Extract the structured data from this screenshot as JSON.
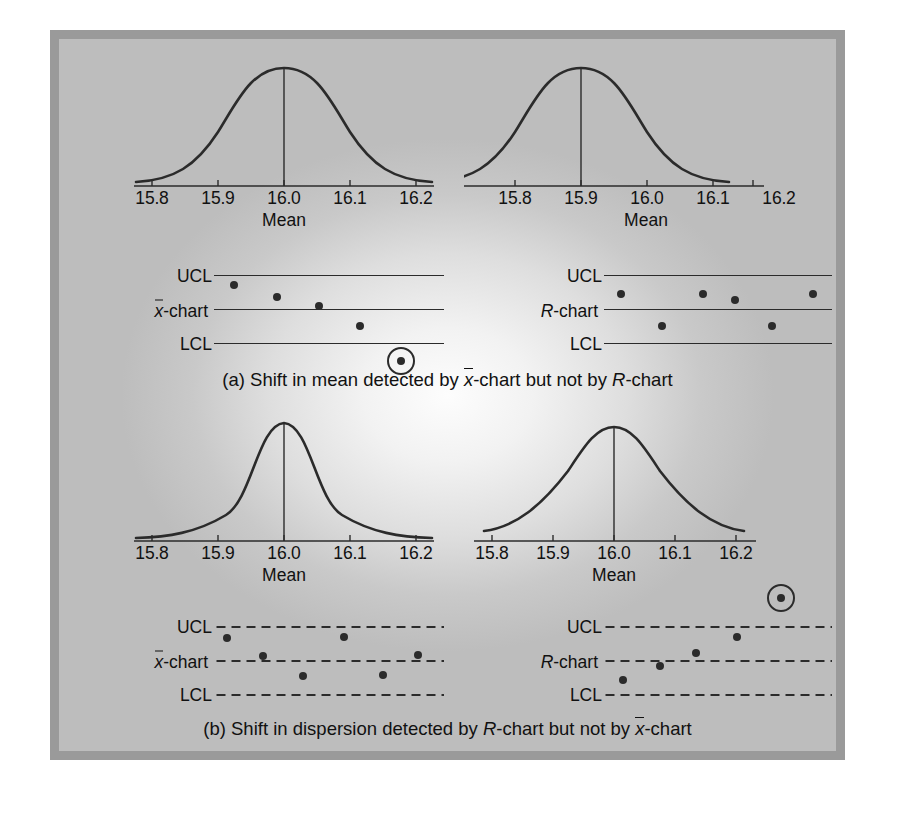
{
  "figure": {
    "frame_color": "#9a9a9a",
    "ink_color": "#2b2b2b"
  },
  "axis": {
    "ticks": [
      "15.8",
      "15.9",
      "16.0",
      "16.1",
      "16.2"
    ],
    "caption": "Mean"
  },
  "labels": {
    "xbar_chart": "-chart",
    "xbar_symbol": "x",
    "r_chart": "-chart",
    "r_symbol": "R",
    "ucl": "UCL",
    "lcl": "LCL"
  },
  "sections": [
    {
      "id": "a",
      "caption_prefix": "(a) Shift in mean detected by ",
      "caption_symbol1": "x",
      "caption_mid": "-chart but not by ",
      "caption_symbol2": "R",
      "caption_suffix": "-chart",
      "left_dist": {
        "name": "in-control-mean-curve",
        "mean": 16.0,
        "sigma": 0.072,
        "peak_label": "16.0",
        "shape": "normal"
      },
      "right_dist": {
        "name": "shifted-mean-curve",
        "mean": 15.9,
        "sigma": 0.072,
        "peak_label": "15.9",
        "shape": "normal"
      },
      "xbar": {
        "line_style": "solid",
        "points": [
          0.085,
          0.275,
          0.455,
          0.635,
          0.815
        ],
        "values": [
          0.88,
          0.64,
          0.47,
          0.22,
          -0.3
        ],
        "flagged_index": 4
      },
      "rchart": {
        "line_style": "solid",
        "points": [
          0.075,
          0.255,
          0.435,
          0.575,
          0.735,
          0.915
        ],
        "values": [
          0.6,
          0.16,
          0.6,
          0.52,
          0.16,
          0.6
        ],
        "flagged_index": -1
      }
    },
    {
      "id": "b",
      "caption_prefix": "(b) Shift in dispersion detected by ",
      "caption_symbol1": "R",
      "caption_mid": "-chart but not by ",
      "caption_symbol2": "x",
      "caption_suffix": "-chart",
      "left_dist": {
        "name": "narrow-dispersion-curve",
        "mean": 16.0,
        "sigma": 0.045,
        "peak_label": "16.0",
        "shape": "peaked"
      },
      "right_dist": {
        "name": "wide-dispersion-curve",
        "mean": 16.0,
        "sigma": 0.105,
        "peak_label": "16.0",
        "shape": "wide"
      },
      "xbar": {
        "line_style": "dashed",
        "points": [
          0.055,
          0.215,
          0.385,
          0.565,
          0.735,
          0.885
        ],
        "values": [
          0.72,
          0.48,
          0.18,
          0.74,
          0.2,
          0.5
        ],
        "flagged_index": -1
      },
      "rchart": {
        "line_style": "dashed",
        "points": [
          0.085,
          0.245,
          0.405,
          0.585,
          0.775
        ],
        "values": [
          0.14,
          0.4,
          0.56,
          0.8,
          1.3
        ],
        "flagged_index": 4
      }
    }
  ]
}
